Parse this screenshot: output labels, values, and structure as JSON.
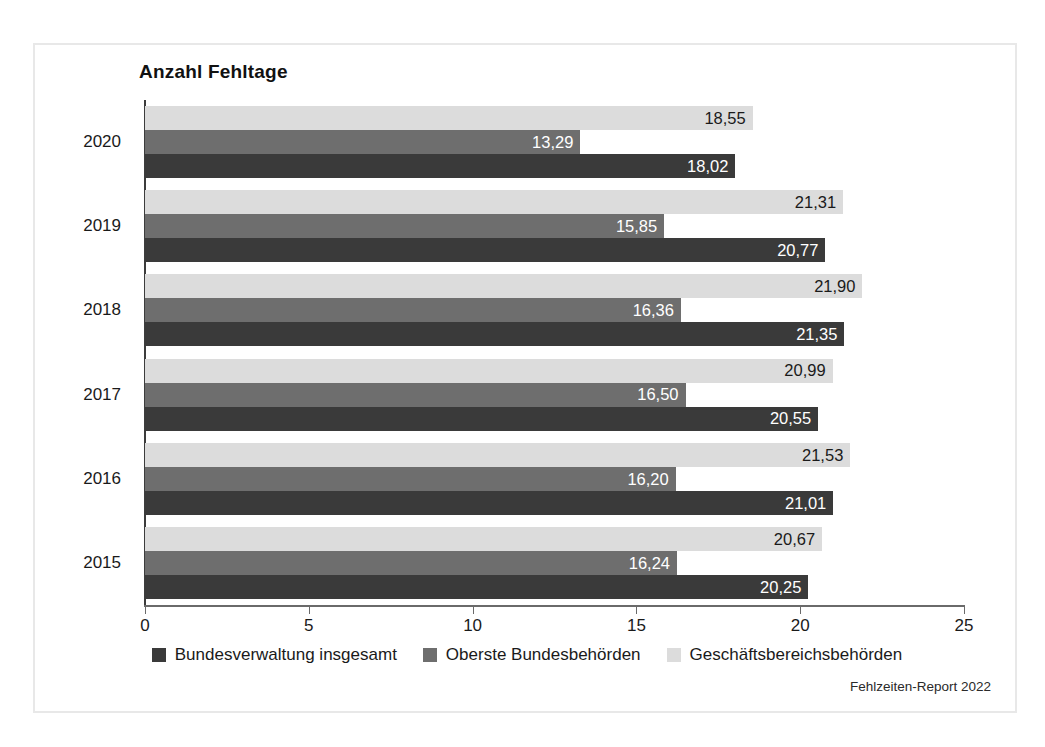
{
  "figure": {
    "title": "Anzahl Fehltage",
    "source_note": "Fehlzeiten-Report 2022",
    "frame_color": "#e8e8e8",
    "background": "#ffffff"
  },
  "legend": {
    "position": "bottom-center",
    "items": [
      {
        "label": "Bundesverwaltung insgesamt",
        "color": "#3a3a3a",
        "swatch": "dark"
      },
      {
        "label": "Oberste Bundesbehörden",
        "color": "#6e6e6e",
        "swatch": "mid"
      },
      {
        "label": "Geschäftsbereichsbehörden",
        "color": "#dcdcdc",
        "swatch": "light"
      }
    ]
  },
  "axes": {
    "x_ticks": [
      "0",
      "5",
      "10",
      "15",
      "20",
      "25"
    ],
    "y_categories": [
      "2020",
      "2019",
      "2018",
      "2017",
      "2016",
      "2015"
    ]
  },
  "chart_data": {
    "type": "bar",
    "orientation": "horizontal",
    "title": "Anzahl Fehltage",
    "xlabel": "",
    "ylabel": "",
    "xlim": [
      0,
      25
    ],
    "xticks": [
      0,
      5,
      10,
      15,
      20,
      25
    ],
    "grid": false,
    "legend_position": "bottom",
    "categories": [
      "2020",
      "2019",
      "2018",
      "2017",
      "2016",
      "2015"
    ],
    "series": [
      {
        "name": "Geschäftsbereichsbehörden",
        "color": "#dcdcdc",
        "values": [
          18.55,
          21.31,
          21.9,
          20.99,
          21.53,
          20.67
        ],
        "labels": [
          "18,55",
          "21,31",
          "21,90",
          "20,99",
          "21,53",
          "20,67"
        ]
      },
      {
        "name": "Oberste Bundesbehörden",
        "color": "#6e6e6e",
        "values": [
          13.29,
          15.85,
          16.36,
          16.5,
          16.2,
          16.24
        ],
        "labels": [
          "13,29",
          "15,85",
          "16,36",
          "16,50",
          "16,20",
          "16,24"
        ]
      },
      {
        "name": "Bundesverwaltung insgesamt",
        "color": "#3a3a3a",
        "values": [
          18.02,
          20.77,
          21.35,
          20.55,
          21.01,
          20.25
        ],
        "labels": [
          "18,02",
          "20,77",
          "21,35",
          "20,55",
          "21,01",
          "20,25"
        ]
      }
    ]
  }
}
